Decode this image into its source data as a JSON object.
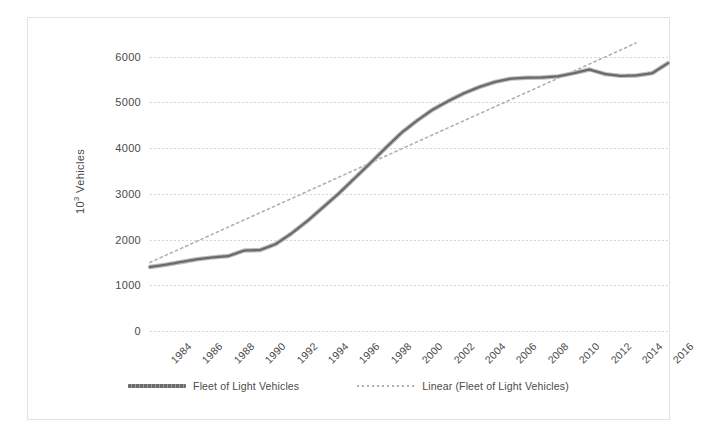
{
  "figure": {
    "background_color": "#ffffff",
    "frame_border_color": "#e3e3e3"
  },
  "axes": {
    "y_axis_title": "10",
    "y_axis_title_exponent": "3",
    "y_axis_title_unit": " Vehicles",
    "y_ticks": [
      "6000",
      "5000",
      "4000",
      "3000",
      "2000",
      "1000",
      "0"
    ],
    "y_tick_values": [
      6000,
      5000,
      4000,
      3000,
      2000,
      1000,
      0
    ],
    "x_ticks": [
      "1984",
      "1986",
      "1988",
      "1990",
      "1992",
      "1994",
      "1996",
      "1998",
      "2000",
      "2002",
      "2004",
      "2006",
      "2008",
      "2010",
      "2012",
      "2014",
      "2016"
    ],
    "x_tick_values": [
      1984,
      1986,
      1988,
      1990,
      1992,
      1994,
      1996,
      1998,
      2000,
      2002,
      2004,
      2006,
      2008,
      2010,
      2012,
      2014,
      2016
    ]
  },
  "legend": {
    "position": "bottom-center",
    "items": [
      {
        "label": "Fleet of Light Vehicles",
        "style": "solid",
        "color": "#6b6b6b"
      },
      {
        "label": "Linear (Fleet of Light Vehicles)",
        "style": "dotted",
        "color": "#b0b0b0"
      }
    ]
  },
  "chart_data": {
    "type": "line",
    "title": "",
    "subtitle": "",
    "xlabel": "",
    "ylabel": "10³ Vehicles",
    "xlim": [
      1984,
      2017
    ],
    "ylim": [
      0,
      6300
    ],
    "grid": true,
    "grid_axis": "y",
    "legend_position": "bottom-center",
    "x": [
      1984,
      1985,
      1986,
      1987,
      1988,
      1989,
      1990,
      1991,
      1992,
      1993,
      1994,
      1995,
      1996,
      1997,
      1998,
      1999,
      2000,
      2001,
      2002,
      2003,
      2004,
      2005,
      2006,
      2007,
      2008,
      2009,
      2010,
      2011,
      2012,
      2013,
      2014,
      2015,
      2016,
      2017
    ],
    "series": [
      {
        "name": "Fleet of Light Vehicles",
        "style": "solid",
        "color": "#6b6b6b",
        "values": [
          1400,
          1450,
          1510,
          1570,
          1610,
          1640,
          1760,
          1770,
          1900,
          2130,
          2400,
          2700,
          3000,
          3330,
          3660,
          4000,
          4330,
          4600,
          4840,
          5030,
          5200,
          5340,
          5450,
          5520,
          5540,
          5545,
          5570,
          5640,
          5720,
          5620,
          5580,
          5590,
          5640,
          5860
        ]
      },
      {
        "name": "Linear (Fleet of Light Vehicles)",
        "style": "dotted",
        "color": "#b0b0b0",
        "trend": true,
        "intercept_1984": 1500,
        "slope_per_year": 155,
        "values": [
          1500,
          1655,
          1810,
          1965,
          2120,
          2275,
          2430,
          2585,
          2740,
          2895,
          3050,
          3205,
          3360,
          3515,
          3670,
          3825,
          3980,
          4135,
          4290,
          4445,
          4600,
          4755,
          4910,
          5065,
          5220,
          5375,
          5530,
          5685,
          5840,
          5995,
          6150,
          6305,
          6460,
          6615
        ]
      }
    ]
  }
}
